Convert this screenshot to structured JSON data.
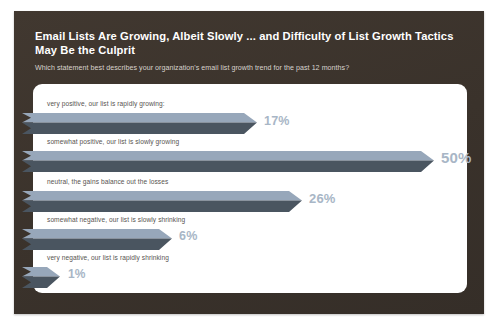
{
  "slide": {
    "title": "Email Lists Are Growing, Albeit Slowly ... and Difficulty of List Growth Tactics May Be the Culprit",
    "subtitle": "Which statement best describes your organization's email list growth trend for the past 12 months?",
    "background_color": "#3b332c",
    "card_color": "#ffffff"
  },
  "chart_data": {
    "type": "bar",
    "title": "Email Lists Are Growing, Albeit Slowly ... and Difficulty of List Growth Tactics May Be the Culprit",
    "subtitle": "Which statement best describes your organization's email list growth trend for the past 12 months?",
    "xlabel": "",
    "ylabel": "",
    "xlim": [
      0,
      50
    ],
    "grid": false,
    "legend": null,
    "orientation": "horizontal",
    "categories": [
      "very positive, our list is rapidly growing:",
      "somewhat positive, our list is slowly growing",
      "neutral, the gains balance out the losses",
      "somewhat negative, our list is slowly shrinking",
      "very negative, our list is rapidly shrinking"
    ],
    "values": [
      17,
      50,
      26,
      6,
      1
    ],
    "value_labels": [
      "17%",
      "50%",
      "26%",
      "6%",
      "1%"
    ],
    "bar_top_color": "#97a7ba",
    "bar_bottom_color": "#4a5560",
    "value_label_color": "#a8b6c6"
  },
  "bars": [
    {
      "label": "very positive, our list is rapidly growing:",
      "value": 17,
      "value_label": "17%",
      "label_top": 16,
      "bar_top": 29,
      "bar_length": 235,
      "value_left": 250,
      "value_top": 31,
      "value_size": 12.5
    },
    {
      "label": "somewhat positive, our list is slowly growing",
      "value": 50,
      "value_label": "50%",
      "label_top": 54,
      "bar_top": 67,
      "bar_length": 412,
      "value_left": 427,
      "value_top": 66,
      "value_size": 15
    },
    {
      "label": "neutral, the gains balance out the losses",
      "value": 26,
      "value_label": "26%",
      "label_top": 94,
      "bar_top": 107,
      "bar_length": 280,
      "value_left": 295,
      "value_top": 108,
      "value_size": 13
    },
    {
      "label": "somewhat negative, our list is slowly shrinking",
      "value": 6,
      "value_label": "6%",
      "label_top": 132,
      "bar_top": 145,
      "bar_length": 150,
      "value_left": 165,
      "value_top": 146,
      "value_size": 12.5
    },
    {
      "label": "very negative, our list is rapidly shrinking",
      "value": 1,
      "value_label": "1%",
      "label_top": 170,
      "bar_top": 183,
      "bar_length": 38,
      "value_left": 54,
      "value_top": 184,
      "value_size": 12
    }
  ]
}
